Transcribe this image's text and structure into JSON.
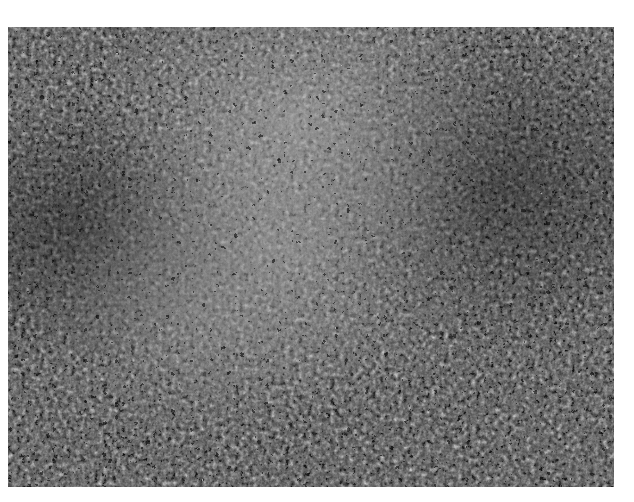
{
  "image": {
    "description": "Grayscale microscopy image of densely packed tissue with a reticular (net-like) bright pattern; a lighter band runs diagonally through the center.",
    "colors": {
      "background": "#ffffff",
      "tissue_dark": "#2a2a2a",
      "tissue_mid": "#6a6a6a",
      "tissue_light": "#9a9a9a",
      "reticulum_highlight": "#d0d0d0"
    }
  }
}
